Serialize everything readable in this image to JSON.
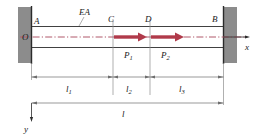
{
  "figure": {
    "colors": {
      "wall_fill": "#8c8c8c",
      "wall_edge": "#3a3a3a",
      "bar_line": "#2b2b2b",
      "centerline": "#b0596a",
      "force_arrow": "#b03a4a",
      "dimension_line": "#6e6e6e",
      "text": "#1a1a1a",
      "background": "#ffffff"
    },
    "points": {
      "origin": "O",
      "a": "A",
      "c": "C",
      "d": "D",
      "b": "B"
    },
    "axes": {
      "x_label": "x",
      "y_label": "y"
    },
    "property": {
      "axial_rigidity": "EA"
    },
    "forces": [
      {
        "name": "P",
        "subscript": "1",
        "direction": "right",
        "applied_at": "C"
      },
      {
        "name": "P",
        "subscript": "2",
        "direction": "right",
        "applied_at": "D"
      }
    ],
    "dimensions": [
      {
        "name": "l",
        "subscript": "1",
        "from": "A",
        "to": "C"
      },
      {
        "name": "l",
        "subscript": "2",
        "from": "C",
        "to": "D"
      },
      {
        "name": "l",
        "subscript": "3",
        "from": "D",
        "to": "B"
      },
      {
        "name": "l",
        "subscript": "",
        "from": "A",
        "to": "B"
      }
    ]
  }
}
